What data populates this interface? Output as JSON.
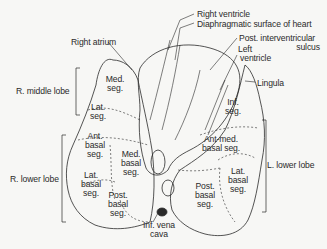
{
  "diagram": {
    "type": "anatomical illustration",
    "labels": {
      "right_ventricle": "Right ventricle",
      "diaphragmatic_surface": "Diaphragmatic surface of heart",
      "post_interventricular_1": "Post. interventricular",
      "post_interventricular_2": "sulcus",
      "left_ventricle_1": "Left",
      "left_ventricle_2": "ventricle",
      "right_atrium": "Right atrium",
      "lingula": "Lingula",
      "r_middle_lobe": "R. middle lobe",
      "r_lower_lobe": "R. lower lobe",
      "l_lower_lobe": "L. lower lobe",
      "inf_vena_cava_1": "Inf. vena",
      "inf_vena_cava_2": "cava"
    },
    "right_lung_segments": {
      "med_seg": [
        "Med.",
        "seg."
      ],
      "lat_seg": [
        "Lat.",
        "seg."
      ],
      "ant_basal": [
        "Ant.",
        "basal",
        "seg."
      ],
      "med_basal": [
        "Med.",
        "basal",
        "seg."
      ],
      "lat_basal": [
        "Lat.",
        "basal",
        "seg."
      ],
      "post_basal": [
        "Post.",
        "basal",
        "seg."
      ]
    },
    "left_lung_segments": {
      "inf_seg": [
        "Inf.",
        "seg."
      ],
      "ant_med_basal": [
        "Ant-med.",
        "basal seg."
      ],
      "lat_basal": [
        "Lat.",
        "basal",
        "seg."
      ],
      "post_basal": [
        "Post.",
        "basal",
        "seg."
      ]
    },
    "colors": {
      "ink": "#2a2a2a",
      "background": "#f7f7f5"
    }
  }
}
